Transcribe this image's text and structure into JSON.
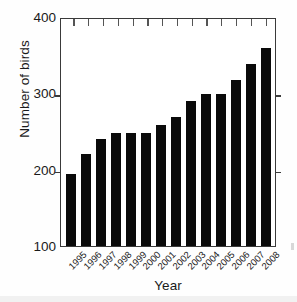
{
  "chart_data": {
    "type": "bar",
    "title": "",
    "xlabel": "Year",
    "ylabel": "Number of birds",
    "categories": [
      "1995",
      "1996",
      "1997",
      "1998",
      "1999",
      "2000",
      "2001",
      "2002",
      "2003",
      "2004",
      "2005",
      "2006",
      "2007",
      "2008"
    ],
    "values": [
      195,
      222,
      242,
      250,
      250,
      250,
      260,
      270,
      291,
      301,
      301,
      320,
      341,
      362
    ],
    "ylim": [
      100,
      400
    ],
    "y_ticks": [
      100,
      200,
      300,
      400
    ],
    "y_tick_labels": [
      "100",
      "200",
      "300",
      "400"
    ],
    "grid": false,
    "legend": "none",
    "bar_color": "#0a0a0a",
    "axis_color": "#3a3a3a",
    "series": [
      {
        "name": "Number of birds",
        "values": [
          195,
          222,
          242,
          250,
          250,
          250,
          260,
          270,
          291,
          301,
          301,
          320,
          341,
          362
        ]
      }
    ]
  },
  "figure": {
    "background": "#ffffff",
    "x_tick_label_rotation": "-45"
  }
}
